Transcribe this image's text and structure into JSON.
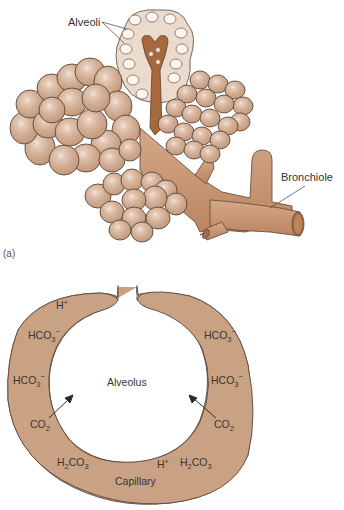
{
  "figure_a": {
    "panel_label": "(a)",
    "labels": {
      "alveoli": "Alveoli",
      "bronchiole": "Bronchiole"
    }
  },
  "figure_b": {
    "center_label": "Alveolus",
    "bottom_label": "Capillary",
    "ions_left": [
      {
        "base": "H",
        "sup": "+"
      },
      {
        "base": "HCO",
        "sub": "3",
        "sup": "−"
      },
      {
        "base": "HCO",
        "sub": "3",
        "sup": "−"
      },
      {
        "base": "CO",
        "sub": "2"
      },
      {
        "base": "H",
        "sub": "2",
        "base2": "CO",
        "sub2": "3"
      }
    ],
    "ions_right": [
      {
        "base": "HCO",
        "sub": "3",
        "sup": "−"
      },
      {
        "base": "HCO",
        "sub": "3",
        "sup": "−"
      },
      {
        "base": "CO",
        "sub": "2"
      },
      {
        "base": "H",
        "sub": "2",
        "base2": "CO",
        "sub2": "3"
      },
      {
        "base": "H",
        "sup": "+"
      }
    ]
  },
  "colors": {
    "tissue": "#c9a284",
    "tissue_dark": "#a8714a",
    "bronchiole": "#c8997a",
    "alveolus_sac": "#d6b296",
    "outline": "#5a4a40",
    "text": "#3a3430"
  }
}
